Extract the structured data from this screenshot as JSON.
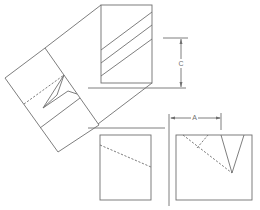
{
  "diagram": {
    "type": "orthographic projection with auxiliary view",
    "views": [
      {
        "name": "top-view",
        "description": "upright rectangle with three diagonal hatch lines"
      },
      {
        "name": "auxiliary-view",
        "description": "rotated rectangle with V-notch and dashed hidden line"
      },
      {
        "name": "front-view",
        "description": "rectangle with dashed diagonal hidden line"
      },
      {
        "name": "side-view",
        "description": "rectangle with V-notch and dashed hidden lines"
      }
    ],
    "dimensions": {
      "c_label": "C",
      "a_label": "A"
    },
    "colors": {
      "line": "#6f6f6f",
      "background": "#ffffff"
    }
  }
}
